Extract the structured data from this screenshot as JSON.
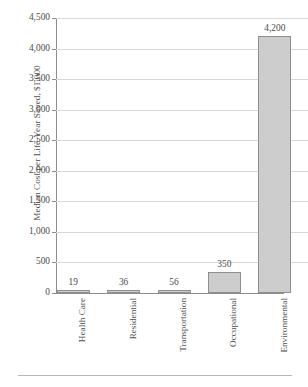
{
  "chart_data": {
    "type": "bar",
    "title": "",
    "xlabel": "",
    "ylabel": "Median Cost per Life-Year Saved, $1,000",
    "categories": [
      "Health Care",
      "Residential",
      "Transportation",
      "Occupational",
      "Environmental"
    ],
    "values": [
      19,
      36,
      56,
      350,
      4200
    ],
    "value_labels": [
      "19",
      "36",
      "56",
      "350",
      "4,200"
    ],
    "ylim": [
      0,
      4500
    ],
    "ytick_values": [
      0,
      500,
      1000,
      1500,
      2000,
      2500,
      3000,
      3500,
      4000,
      4500
    ],
    "ytick_labels": [
      "0",
      "500",
      "1,000",
      "1,500",
      "2,000",
      "2,500",
      "3,000",
      "3,500",
      "4,000",
      "4,500"
    ],
    "grid": true,
    "legend": "none",
    "bar_fill_color": "#cdcdcd",
    "bar_border_color": "#8f8f8f",
    "gridline_color": "#d8d8d8",
    "axis_color": "#8c8c8c",
    "text_color": "#4a4a4a"
  }
}
